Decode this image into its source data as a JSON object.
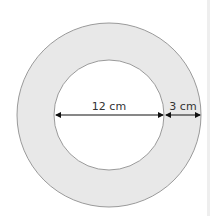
{
  "diagram": {
    "type": "annulus",
    "colors": {
      "ring_fill": "#e8e8e8",
      "inner_fill": "#ffffff",
      "stroke": "#9a9a9a",
      "arrow": "#111111",
      "label": "#333333"
    },
    "inner_diameter_label": "12 cm",
    "ring_width_label": "3 cm"
  }
}
